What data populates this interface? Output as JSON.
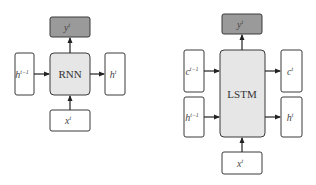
{
  "rnn_diagram": {
    "core_label": "RNN",
    "output": {
      "base": "y",
      "sup": "t"
    },
    "input": {
      "base": "x",
      "sup": "t"
    },
    "hidden_in": {
      "base": "h",
      "sup": "t−1"
    },
    "hidden_out": {
      "base": "h",
      "sup": "t"
    }
  },
  "lstm_diagram": {
    "core_label": "LSTM",
    "output": {
      "base": "y",
      "sup": "t"
    },
    "input": {
      "base": "x",
      "sup": "t"
    },
    "cell_in": {
      "base": "c",
      "sup": "t−1"
    },
    "cell_out": {
      "base": "c",
      "sup": "t"
    },
    "hidden_in": {
      "base": "h",
      "sup": "t−1"
    },
    "hidden_out": {
      "base": "h",
      "sup": "t"
    }
  },
  "colors": {
    "output_fill": "#9a9a9a",
    "core_fill": "#e6e6e6",
    "io_fill": "#ffffff",
    "stroke": "#3a3a3a"
  }
}
